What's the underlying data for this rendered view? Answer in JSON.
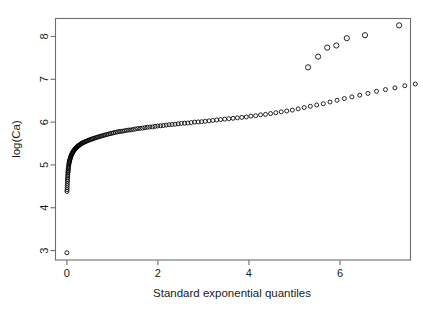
{
  "chart_data": {
    "type": "scatter",
    "title": "",
    "subtitle": "",
    "xlabel": "Standard exponential quantiles",
    "ylabel": "log(Ca)",
    "xlim": [
      -0.25,
      7.55
    ],
    "ylim": [
      2.78,
      8.42
    ],
    "xticks": [
      0,
      2,
      4,
      6
    ],
    "xticklabels": [
      "0",
      "2",
      "4",
      "6"
    ],
    "yticks": [
      3,
      4,
      5,
      6,
      7,
      8
    ],
    "yticklabels": [
      "3",
      "4",
      "5",
      "6",
      "7",
      "8"
    ],
    "grid": false,
    "legend": null,
    "marker": "open-circle",
    "marker_color": "#000000",
    "frame_color": "#6e6e6e",
    "annotations": [],
    "points": [
      [
        0.0,
        2.95
      ],
      [
        0.002,
        4.38
      ],
      [
        0.004,
        4.42
      ],
      [
        0.006,
        4.47
      ],
      [
        0.008,
        4.52
      ],
      [
        0.01,
        4.57
      ],
      [
        0.012,
        4.62
      ],
      [
        0.014,
        4.66
      ],
      [
        0.016,
        4.7
      ],
      [
        0.018,
        4.74
      ],
      [
        0.02,
        4.78
      ],
      [
        0.023,
        4.82
      ],
      [
        0.026,
        4.85
      ],
      [
        0.029,
        4.88
      ],
      [
        0.032,
        4.91
      ],
      [
        0.035,
        4.94
      ],
      [
        0.038,
        4.97
      ],
      [
        0.042,
        5.0
      ],
      [
        0.046,
        5.03
      ],
      [
        0.05,
        5.05
      ],
      [
        0.055,
        5.08
      ],
      [
        0.06,
        5.1
      ],
      [
        0.065,
        5.12
      ],
      [
        0.07,
        5.14
      ],
      [
        0.076,
        5.16
      ],
      [
        0.082,
        5.18
      ],
      [
        0.088,
        5.2
      ],
      [
        0.095,
        5.22
      ],
      [
        0.102,
        5.24
      ],
      [
        0.11,
        5.26
      ],
      [
        0.118,
        5.27
      ],
      [
        0.126,
        5.29
      ],
      [
        0.135,
        5.31
      ],
      [
        0.145,
        5.32
      ],
      [
        0.155,
        5.34
      ],
      [
        0.165,
        5.35
      ],
      [
        0.176,
        5.37
      ],
      [
        0.188,
        5.38
      ],
      [
        0.2,
        5.4
      ],
      [
        0.213,
        5.41
      ],
      [
        0.226,
        5.42
      ],
      [
        0.24,
        5.44
      ],
      [
        0.255,
        5.45
      ],
      [
        0.27,
        5.46
      ],
      [
        0.286,
        5.47
      ],
      [
        0.303,
        5.49
      ],
      [
        0.32,
        5.5
      ],
      [
        0.338,
        5.51
      ],
      [
        0.357,
        5.52
      ],
      [
        0.377,
        5.53
      ],
      [
        0.397,
        5.54
      ],
      [
        0.418,
        5.55
      ],
      [
        0.44,
        5.56
      ],
      [
        0.463,
        5.57
      ],
      [
        0.487,
        5.58
      ],
      [
        0.512,
        5.59
      ],
      [
        0.537,
        5.6
      ],
      [
        0.563,
        5.61
      ],
      [
        0.59,
        5.62
      ],
      [
        0.618,
        5.63
      ],
      [
        0.647,
        5.64
      ],
      [
        0.677,
        5.65
      ],
      [
        0.708,
        5.66
      ],
      [
        0.74,
        5.67
      ],
      [
        0.772,
        5.68
      ],
      [
        0.805,
        5.69
      ],
      [
        0.839,
        5.7
      ],
      [
        0.874,
        5.71
      ],
      [
        0.91,
        5.72
      ],
      [
        0.947,
        5.73
      ],
      [
        0.985,
        5.74
      ],
      [
        1.024,
        5.75
      ],
      [
        1.063,
        5.76
      ],
      [
        1.103,
        5.77
      ],
      [
        1.144,
        5.78
      ],
      [
        1.186,
        5.785
      ],
      [
        1.229,
        5.79
      ],
      [
        1.273,
        5.8
      ],
      [
        1.318,
        5.81
      ],
      [
        1.364,
        5.815
      ],
      [
        1.411,
        5.82
      ],
      [
        1.459,
        5.83
      ],
      [
        1.508,
        5.84
      ],
      [
        1.558,
        5.85
      ],
      [
        1.609,
        5.855
      ],
      [
        1.661,
        5.86
      ],
      [
        1.714,
        5.87
      ],
      [
        1.768,
        5.88
      ],
      [
        1.823,
        5.885
      ],
      [
        1.88,
        5.89
      ],
      [
        1.938,
        5.9
      ],
      [
        1.997,
        5.91
      ],
      [
        2.057,
        5.915
      ],
      [
        2.118,
        5.92
      ],
      [
        2.181,
        5.93
      ],
      [
        2.245,
        5.94
      ],
      [
        2.31,
        5.945
      ],
      [
        2.377,
        5.95
      ],
      [
        2.445,
        5.96
      ],
      [
        2.514,
        5.97
      ],
      [
        2.585,
        5.975
      ],
      [
        2.657,
        5.98
      ],
      [
        2.731,
        5.99
      ],
      [
        2.806,
        6.0
      ],
      [
        2.883,
        6.005
      ],
      [
        2.961,
        6.01
      ],
      [
        3.041,
        6.02
      ],
      [
        3.123,
        6.03
      ],
      [
        3.206,
        6.04
      ],
      [
        3.291,
        6.05
      ],
      [
        3.378,
        6.06
      ],
      [
        3.467,
        6.07
      ],
      [
        3.558,
        6.08
      ],
      [
        3.651,
        6.09
      ],
      [
        3.746,
        6.1
      ],
      [
        3.843,
        6.11
      ],
      [
        3.942,
        6.12
      ],
      [
        4.044,
        6.14
      ],
      [
        4.148,
        6.15
      ],
      [
        4.255,
        6.17
      ],
      [
        4.364,
        6.18
      ],
      [
        4.476,
        6.2
      ],
      [
        4.591,
        6.22
      ],
      [
        4.709,
        6.24
      ],
      [
        4.83,
        6.26
      ],
      [
        4.954,
        6.28
      ],
      [
        5.082,
        6.31
      ],
      [
        5.214,
        6.34
      ],
      [
        5.349,
        6.37
      ],
      [
        5.489,
        6.4
      ],
      [
        5.633,
        6.43
      ],
      [
        5.782,
        6.47
      ],
      [
        5.936,
        6.51
      ],
      [
        6.096,
        6.55
      ],
      [
        6.262,
        6.59
      ],
      [
        6.435,
        6.63
      ],
      [
        6.615,
        6.67
      ],
      [
        6.803,
        6.72
      ],
      [
        7.0,
        6.76
      ],
      [
        7.207,
        6.8
      ],
      [
        7.425,
        6.85
      ],
      [
        7.656,
        6.89
      ]
    ],
    "tail_points": [
      [
        5.3,
        7.28
      ],
      [
        5.52,
        7.53
      ],
      [
        5.72,
        7.74
      ],
      [
        5.92,
        7.79
      ],
      [
        6.15,
        7.96
      ],
      [
        6.55,
        8.03
      ],
      [
        7.3,
        8.26
      ]
    ]
  }
}
